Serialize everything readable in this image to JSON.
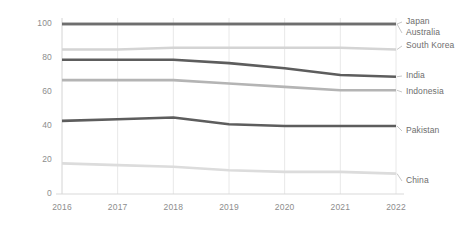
{
  "chart_data": {
    "type": "line",
    "title": "",
    "subtitle": "",
    "xlabel": "",
    "ylabel": "",
    "x": [
      2016,
      2017,
      2018,
      2019,
      2020,
      2021,
      2022
    ],
    "categories": [
      "2016",
      "2017",
      "2018",
      "2019",
      "2020",
      "2021",
      "2022"
    ],
    "xtick_labels": [
      "2016",
      "2017",
      "2018",
      "2019",
      "2020",
      "2021",
      "2022"
    ],
    "ytick_labels": [
      "0",
      "20",
      "40",
      "60",
      "80",
      "100"
    ],
    "yticks": [
      0,
      20,
      40,
      60,
      80,
      100
    ],
    "ylim": [
      0,
      100
    ],
    "xlim": [
      2016,
      2022
    ],
    "grid": "vertical",
    "legend_position": "right-inline-labels",
    "series": [
      {
        "name": "Japan",
        "color": "#6e6e6e",
        "values": [
          100,
          100,
          100,
          100,
          100,
          100,
          100
        ],
        "label": "Japan"
      },
      {
        "name": "Australia",
        "color": "#6e6e6e",
        "values": [
          100,
          100,
          100,
          100,
          100,
          100,
          100
        ],
        "label": "Australia"
      },
      {
        "name": "South Korea",
        "color": "#d4d4d4",
        "values": [
          85,
          85,
          86,
          86,
          86,
          86,
          85
        ],
        "label": "South Korea"
      },
      {
        "name": "India",
        "color": "#5d5d5d",
        "values": [
          79,
          79,
          79,
          77,
          74,
          70,
          69
        ],
        "label": "India"
      },
      {
        "name": "Indonesia",
        "color": "#b4b4b4",
        "values": [
          67,
          67,
          67,
          65,
          63,
          61,
          61
        ],
        "label": "Indonesia"
      },
      {
        "name": "Pakistan",
        "color": "#5d5d5d",
        "values": [
          43,
          44,
          45,
          41,
          40,
          40,
          40
        ],
        "label": "Pakistan"
      },
      {
        "name": "China",
        "color": "#dcdcdc",
        "values": [
          18,
          17,
          16,
          14,
          13,
          13,
          12
        ],
        "label": "China"
      }
    ],
    "colors": {
      "axis_text": "#8d8d8d",
      "gridline": "#e8e8e8",
      "label_text": "#6e6e6e",
      "background": "#ffffff"
    }
  }
}
